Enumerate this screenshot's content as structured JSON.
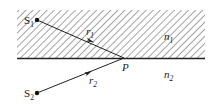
{
  "diagram": {
    "type": "refraction-interface",
    "media": {
      "upper": {
        "label": "n",
        "subscript": "1",
        "hatched": true
      },
      "lower": {
        "label": "n",
        "subscript": "2",
        "hatched": false
      }
    },
    "point_P": {
      "label": "P"
    },
    "sources": [
      {
        "label": "S",
        "subscript": "1"
      },
      {
        "label": "S",
        "subscript": "2"
      }
    ],
    "rays": [
      {
        "label": "r",
        "subscript": "1",
        "from": "S1",
        "to": "P"
      },
      {
        "label": "r",
        "subscript": "2",
        "from": "S2",
        "to": "P"
      }
    ],
    "colors": {
      "line": "#222222",
      "hatch": "#555555",
      "background": "#ffffff"
    }
  }
}
